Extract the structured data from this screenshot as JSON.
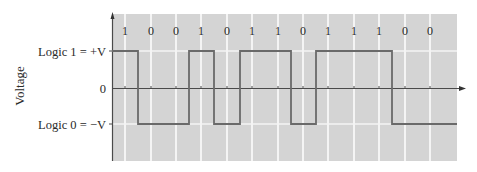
{
  "diagram": {
    "type": "digital-signal-waveform",
    "y_axis_label": "Voltage",
    "level_labels": {
      "high": "Logic 1 = +V",
      "zero": "0",
      "low": "Logic 0 = −V"
    },
    "bits": [
      "1",
      "0",
      "0",
      "1",
      "0",
      "1",
      "1",
      "0",
      "1",
      "1",
      "1",
      "0",
      "0"
    ],
    "colors": {
      "plot_background": "#d4d4d4",
      "grid": "#f4f4f4",
      "waveform": "#6a6a6a",
      "axis": "#4a4a4a",
      "text": "#2a2a2a"
    }
  }
}
